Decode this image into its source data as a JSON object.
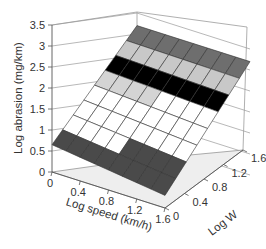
{
  "chart_data": {
    "type": "surface3d",
    "title": "",
    "zlabel": "Log abrasion (mg/km)",
    "xlabel": "Log speed (km/h)",
    "ylabel": "Log W",
    "z_ticks": [
      "0",
      "0.5",
      "1",
      "1.5",
      "2",
      "2.5",
      "3",
      "3.5"
    ],
    "x_ticks": [
      "0",
      "0.4",
      "0.8",
      "1.2",
      "1.6"
    ],
    "y_ticks": [
      "0",
      "0.4",
      "0.8",
      "1.2",
      "1.6"
    ],
    "zlim": [
      0,
      3.5
    ],
    "xlim": [
      0,
      1.6
    ],
    "ylim": [
      0,
      1.6
    ],
    "grid": true,
    "surface": {
      "description": "Planar surface increasing with Log W; abrasion rises from ~0.3-0.7 at Log W=0 to ~3.2 at Log W=1.6, slightly increasing with Log speed",
      "corners": [
        {
          "log_speed": 0,
          "log_w": 0,
          "log_abrasion": 0.65
        },
        {
          "log_speed": 1.6,
          "log_w": 0,
          "log_abrasion": 0.3
        },
        {
          "log_speed": 0,
          "log_w": 1.6,
          "log_abrasion": 3.2
        },
        {
          "log_speed": 1.6,
          "log_w": 1.6,
          "log_abrasion": 3.2
        }
      ],
      "color_bands": [
        {
          "range": [
            0,
            0.5
          ],
          "color": "#8a8a8a"
        },
        {
          "range": [
            0.5,
            1.0
          ],
          "color": "#4a4a4a"
        },
        {
          "range": [
            1.0,
            2.0
          ],
          "color": "#ffffff"
        },
        {
          "range": [
            2.0,
            2.2
          ],
          "color": "#d4d4d4"
        },
        {
          "range": [
            2.2,
            2.6
          ],
          "color": "#000000"
        },
        {
          "range": [
            2.6,
            3.0
          ],
          "color": "#c8c8c8"
        },
        {
          "range": [
            3.0,
            3.5
          ],
          "color": "#6e6e6e"
        }
      ]
    }
  }
}
